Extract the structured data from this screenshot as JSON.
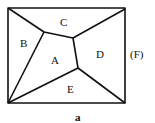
{
  "diagram": {
    "regions": [
      {
        "id": "A",
        "label": "A"
      },
      {
        "id": "B",
        "label": "B"
      },
      {
        "id": "C",
        "label": "C"
      },
      {
        "id": "D",
        "label": "D"
      },
      {
        "id": "E",
        "label": "E"
      }
    ],
    "outer_label": "(F)",
    "caption": "a",
    "stroke_color": "#111111"
  }
}
